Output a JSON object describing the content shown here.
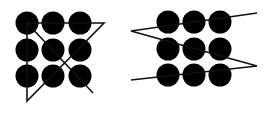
{
  "colors": {
    "dot": "#000000",
    "line": "#111111",
    "background": "#ffffff"
  },
  "figures": [
    {
      "name": "four-line-solution",
      "dot_radius": 11.5,
      "dots": [
        [
          27,
          23
        ],
        [
          53,
          23
        ],
        [
          80,
          23
        ],
        [
          27,
          50
        ],
        [
          53,
          50
        ],
        [
          80,
          50
        ],
        [
          27,
          76
        ],
        [
          53,
          76
        ],
        [
          80,
          76
        ]
      ],
      "path": [
        [
          93,
          93
        ],
        [
          27,
          23
        ],
        [
          27,
          101
        ],
        [
          104,
          23
        ],
        [
          27,
          23
        ]
      ]
    },
    {
      "name": "three-line-solution",
      "dot_radius": 11.5,
      "dots": [
        [
          168,
          22
        ],
        [
          194,
          22
        ],
        [
          220,
          22
        ],
        [
          168,
          49
        ],
        [
          194,
          49
        ],
        [
          220,
          49
        ],
        [
          168,
          75
        ],
        [
          194,
          75
        ],
        [
          220,
          75
        ]
      ],
      "path": [
        [
          257,
          13
        ],
        [
          131,
          31
        ],
        [
          257,
          66
        ],
        [
          131,
          80
        ]
      ]
    }
  ]
}
